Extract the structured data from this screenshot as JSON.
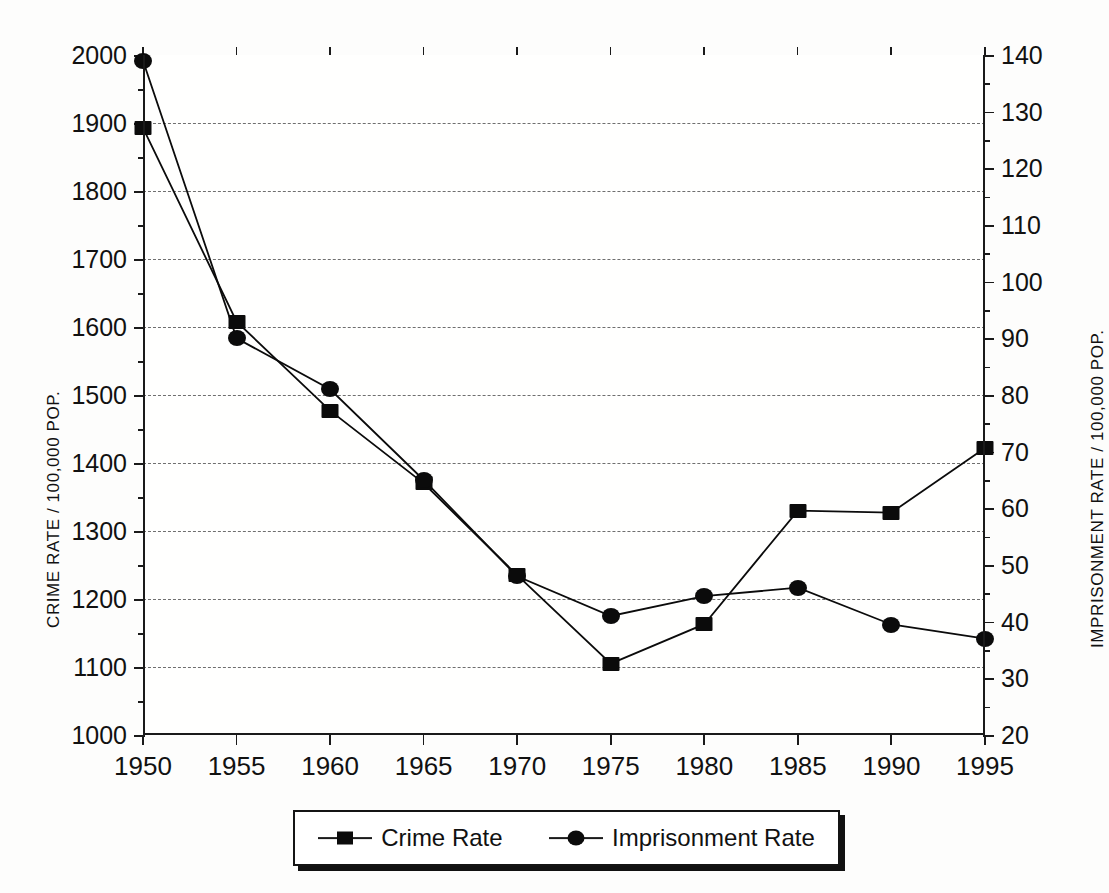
{
  "chart_data": {
    "type": "line",
    "title": "",
    "xlabel": "",
    "grid": true,
    "legend_position": "bottom",
    "categories": [
      1950,
      1955,
      1960,
      1965,
      1970,
      1975,
      1980,
      1985,
      1990,
      1995
    ],
    "x_tick_labels": [
      "1950",
      "1955",
      "1960",
      "1965",
      "1970",
      "1975",
      "1980",
      "1985",
      "1990",
      "1995"
    ],
    "left_axis": {
      "label": "CRIME RATE / 100,000 POP.",
      "ylim": [
        1000,
        2000
      ],
      "tick_step": 100,
      "minor_tick_step": 50,
      "tick_labels": [
        "1000",
        "1100",
        "1200",
        "1300",
        "1400",
        "1500",
        "1600",
        "1700",
        "1800",
        "1900",
        "2000"
      ]
    },
    "right_axis": {
      "label": "IMPRISONMENT RATE / 100,000 POP.",
      "ylim": [
        20,
        140
      ],
      "tick_step": 10,
      "minor_tick_step": 5,
      "tick_labels": [
        "20",
        "30",
        "40",
        "50",
        "60",
        "70",
        "80",
        "90",
        "100",
        "110",
        "120",
        "130",
        "140"
      ]
    },
    "series": [
      {
        "name": "Crime Rate",
        "axis": "left",
        "marker": "square",
        "values": [
          1893,
          1608,
          1477,
          1370,
          1235,
          1105,
          1163,
          1330,
          1327,
          1422
        ]
      },
      {
        "name": "Imprisonment Rate",
        "axis": "right",
        "marker": "circle",
        "values": [
          139,
          90,
          81,
          65,
          48,
          41,
          44.5,
          46,
          39.5,
          37
        ]
      }
    ]
  },
  "legend": {
    "entries": [
      {
        "label": "Crime Rate",
        "marker": "square-marker"
      },
      {
        "label": "Imprisonment Rate",
        "marker": "circle-marker"
      }
    ]
  },
  "colors": {
    "ink": "#0b0b0b",
    "grid": "#6f6f6f",
    "background": "#fdfdfc"
  }
}
